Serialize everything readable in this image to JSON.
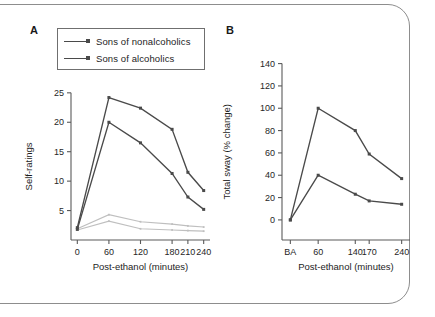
{
  "figure": {
    "background_color": "#ffffff",
    "frame_color": "#8d8d8d",
    "dark_series_color": "#4a4a4a",
    "faint_series_color": "#bfbfbf",
    "axis_color": "#5a5a5a"
  },
  "legend": {
    "items": [
      {
        "label": "Sons of nonalcoholics",
        "color": "#4a4a4a"
      },
      {
        "label": "Sons of alcoholics",
        "color": "#4a4a4a"
      }
    ]
  },
  "panels": {
    "a": {
      "letter": "A"
    },
    "b": {
      "letter": "B"
    }
  },
  "chart_data": [
    {
      "type": "line",
      "panel": "A",
      "title": "",
      "xlabel": "Post-ethanol (minutes)",
      "ylabel": "Self-ratings",
      "categories": [
        "0",
        "60",
        "120",
        "180",
        "210",
        "240"
      ],
      "x": [
        0,
        60,
        120,
        180,
        210,
        240
      ],
      "xticklabels": [
        "0",
        "60",
        "120",
        "180",
        "210",
        "240"
      ],
      "yticks": [
        5,
        10,
        15,
        20,
        25
      ],
      "yticklabels": [
        "5",
        "10",
        "15",
        "20",
        "25"
      ],
      "ylim": [
        0,
        26.5
      ],
      "xlim": [
        -12,
        252
      ],
      "grid": false,
      "legend_position": "above-plot-left",
      "series": [
        {
          "name": "Sons of nonalcoholics",
          "color": "#4a4a4a",
          "emphasis": "dark",
          "values": [
            2.1,
            24.2,
            22.4,
            18.8,
            11.5,
            8.4
          ]
        },
        {
          "name": "Sons of alcoholics",
          "color": "#4a4a4a",
          "emphasis": "dark",
          "values": [
            1.8,
            20.0,
            16.5,
            11.3,
            7.3,
            5.2
          ]
        },
        {
          "name": "Faint lower trace 1",
          "color": "#bfbfbf",
          "emphasis": "faint",
          "values": [
            1.9,
            4.3,
            3.1,
            2.7,
            2.4,
            2.2
          ]
        },
        {
          "name": "Faint lower trace 2",
          "color": "#bfbfbf",
          "emphasis": "faint",
          "values": [
            1.7,
            3.2,
            1.9,
            1.7,
            1.6,
            1.5
          ]
        }
      ]
    },
    {
      "type": "line",
      "panel": "B",
      "title": "",
      "xlabel": "Post-ethanol (minutes)",
      "ylabel": "Total sway (% change)",
      "categories": [
        "BA",
        "60",
        "140",
        "170",
        "240"
      ],
      "x": [
        0,
        60,
        140,
        170,
        240
      ],
      "xticklabels": [
        "BA",
        "60",
        "140",
        "170",
        "240"
      ],
      "yticks": [
        0,
        20,
        40,
        60,
        80,
        100,
        120,
        140
      ],
      "yticklabels": [
        "0",
        "20",
        "40",
        "60",
        "80",
        "100",
        "120",
        "140"
      ],
      "ylim": [
        -18,
        145
      ],
      "xlim": [
        -18,
        258
      ],
      "grid": false,
      "legend_position": "none",
      "series": [
        {
          "name": "Sons of nonalcoholics",
          "color": "#4a4a4a",
          "emphasis": "dark",
          "values": [
            0,
            100,
            80,
            59,
            37
          ]
        },
        {
          "name": "Sons of alcoholics",
          "color": "#4a4a4a",
          "emphasis": "dark",
          "values": [
            0,
            40,
            23,
            17,
            14
          ]
        }
      ]
    }
  ]
}
